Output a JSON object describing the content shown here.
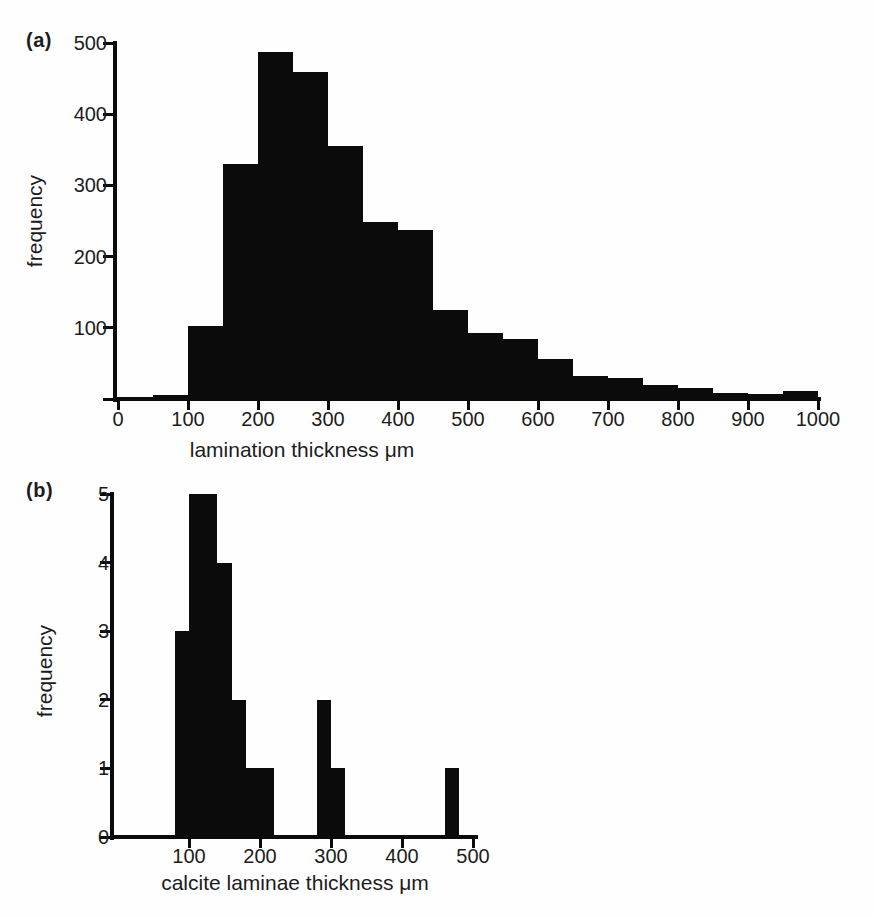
{
  "figure": {
    "background_color": "#fefefe",
    "bar_color": "#0b0b0b",
    "text_color": "#1c1c1c"
  },
  "chart_data": [
    {
      "type": "bar",
      "subtype": "histogram",
      "panel_label": "(a)",
      "xlabel": "lamination thickness μm",
      "ylabel": "frequency",
      "xlim": [
        0,
        1000
      ],
      "ylim": [
        0,
        500
      ],
      "xticks": [
        0,
        100,
        200,
        300,
        400,
        500,
        600,
        700,
        800,
        900,
        1000
      ],
      "yticks": [
        100,
        200,
        300,
        400,
        500
      ],
      "grid": false,
      "bin_width": 50,
      "bin_starts": [
        0,
        50,
        100,
        150,
        200,
        250,
        300,
        350,
        400,
        450,
        500,
        550,
        600,
        650,
        700,
        750,
        800,
        850,
        900,
        950
      ],
      "frequencies": [
        2,
        6,
        103,
        330,
        488,
        459,
        355,
        249,
        237,
        125,
        92,
        84,
        56,
        32,
        29,
        20,
        16,
        9,
        7,
        11
      ]
    },
    {
      "type": "bar",
      "subtype": "histogram",
      "panel_label": "(b)",
      "xlabel": "calcite laminae thickness μm",
      "ylabel": "frequency",
      "xlim": [
        0,
        500
      ],
      "ylim": [
        0,
        5
      ],
      "xticks": [
        100,
        200,
        300,
        400,
        500
      ],
      "yticks": [
        0,
        1,
        2,
        3,
        4,
        5
      ],
      "grid": false,
      "bin_width": 20,
      "bin_starts": [
        80,
        100,
        120,
        140,
        160,
        180,
        200,
        220,
        240,
        260,
        280,
        300,
        320,
        340,
        360,
        380,
        400,
        420,
        440,
        460
      ],
      "frequencies": [
        3,
        5,
        5,
        4,
        2,
        1,
        1,
        0,
        0,
        0,
        2,
        1,
        0,
        0,
        0,
        0,
        0,
        0,
        0,
        1
      ]
    }
  ]
}
